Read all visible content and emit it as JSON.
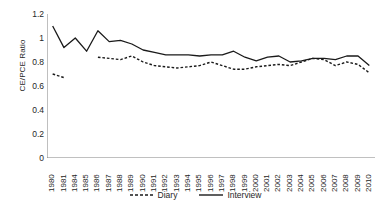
{
  "chart_data": {
    "type": "line",
    "title": "",
    "xlabel": "",
    "ylabel": "CE/PCE Ratio",
    "ylim": [
      0,
      1.2
    ],
    "yticks": [
      0,
      0.2,
      0.4,
      0.6,
      0.8,
      1,
      1.2
    ],
    "ytick_labels": [
      "0",
      "0.2",
      "0.4",
      "0.6",
      "0.8",
      "1",
      "1.2"
    ],
    "grid": false,
    "legend_position": "bottom",
    "categories": [
      "1980",
      "1981",
      "1984",
      "1985",
      "1986",
      "1987",
      "1988",
      "1989",
      "1990",
      "1991",
      "1992",
      "1993",
      "1994",
      "1995",
      "1996",
      "1997",
      "1998",
      "1999",
      "2000",
      "2001",
      "2002",
      "2003",
      "2004",
      "2005",
      "2006",
      "2007",
      "2008",
      "2009",
      "2010"
    ],
    "series": [
      {
        "name": "Diary",
        "style": "dashed",
        "color": "#1a1a1a",
        "values": [
          0.7,
          0.67,
          null,
          null,
          0.84,
          0.83,
          0.82,
          0.85,
          0.8,
          0.77,
          0.76,
          0.75,
          0.76,
          0.77,
          0.8,
          0.77,
          0.74,
          0.74,
          0.76,
          0.77,
          0.78,
          0.77,
          0.8,
          0.83,
          0.82,
          0.77,
          0.8,
          0.78,
          0.71
        ]
      },
      {
        "name": "Interview",
        "style": "solid",
        "color": "#1a1a1a",
        "values": [
          1.1,
          0.92,
          1.0,
          0.89,
          1.06,
          0.97,
          0.98,
          0.95,
          0.9,
          0.88,
          0.86,
          0.86,
          0.86,
          0.85,
          0.86,
          0.86,
          0.89,
          0.84,
          0.81,
          0.84,
          0.85,
          0.8,
          0.81,
          0.83,
          0.83,
          0.82,
          0.85,
          0.85,
          0.77
        ]
      }
    ]
  },
  "legend": {
    "items": [
      {
        "label": "Diary",
        "style": "dashed"
      },
      {
        "label": "Interview",
        "style": "solid"
      }
    ]
  }
}
